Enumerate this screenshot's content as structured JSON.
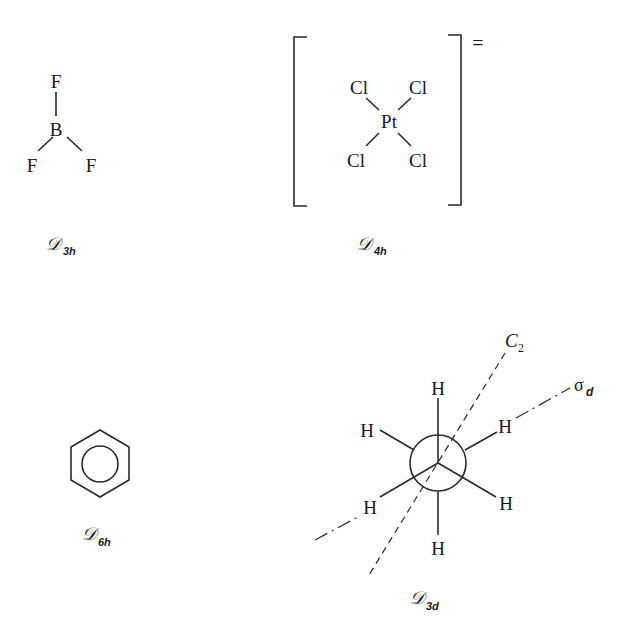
{
  "figure": {
    "molecules": [
      {
        "id": "bf3",
        "atoms": {
          "top": "F",
          "center": "B",
          "left": "F",
          "right": "F"
        },
        "point_group": {
          "letter": "𝒟",
          "subscript": "3h"
        }
      },
      {
        "id": "ptcl4",
        "atoms": {
          "center": "Pt",
          "top_left": "Cl",
          "top_right": "Cl",
          "bottom_left": "Cl",
          "bottom_right": "Cl"
        },
        "charge": "=",
        "point_group": {
          "letter": "𝒟",
          "subscript": "4h"
        }
      },
      {
        "id": "benzene",
        "point_group": {
          "letter": "𝒟",
          "subscript": "6h"
        }
      },
      {
        "id": "ethane-staggered",
        "atoms": {
          "top": "H",
          "upper_left": "H",
          "upper_right": "H",
          "lower_left": "H",
          "lower_right": "H",
          "bottom": "H"
        },
        "axes": {
          "c2": "C",
          "c2_sub": "2",
          "sigma": "σ",
          "sigma_sub": "d"
        },
        "point_group": {
          "letter": "𝒟",
          "subscript": "3d"
        }
      }
    ]
  }
}
